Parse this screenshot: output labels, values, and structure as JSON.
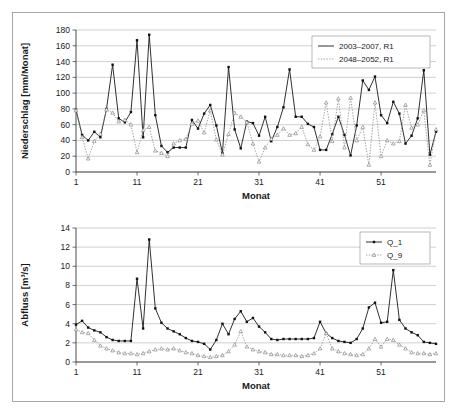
{
  "figure": {
    "background_color": "#ffffff",
    "border_color": "#a8a8a8",
    "solid_series_color": "#1a1a1a",
    "dotted_series_color": "#8a8a8a",
    "gridline_color": "#b0b0b0"
  },
  "chart_data": [
    {
      "id": "precipitation",
      "type": "line",
      "title": "",
      "xlabel": "Monat",
      "ylabel": "Niederschlag [mm/Monat]",
      "ylim": [
        0,
        180
      ],
      "xlim": [
        1,
        60
      ],
      "yticks": [
        0,
        20,
        40,
        60,
        80,
        100,
        120,
        140,
        160,
        180
      ],
      "xticks": [
        1,
        11,
        21,
        31,
        41,
        51
      ],
      "grid": true,
      "legend_position": "top-right",
      "x": [
        1,
        2,
        3,
        4,
        5,
        6,
        7,
        8,
        9,
        10,
        11,
        12,
        13,
        14,
        15,
        16,
        17,
        18,
        19,
        20,
        21,
        22,
        23,
        24,
        25,
        26,
        27,
        28,
        29,
        30,
        31,
        32,
        33,
        34,
        35,
        36,
        37,
        38,
        39,
        40,
        41,
        42,
        43,
        44,
        45,
        46,
        47,
        48,
        49,
        50,
        51,
        52,
        53,
        54,
        55,
        56,
        57,
        58,
        59,
        60
      ],
      "series": [
        {
          "name": "2003–2007, R1",
          "style": "solid",
          "marker": "filled-square",
          "values": [
            79,
            47,
            40,
            51,
            44,
            80,
            136,
            68,
            63,
            76,
            167,
            44,
            174,
            72,
            33,
            25,
            31,
            31,
            31,
            66,
            55,
            74,
            85,
            59,
            24,
            133,
            54,
            30,
            64,
            62,
            46,
            70,
            39,
            57,
            82,
            130,
            70,
            70,
            61,
            57,
            28,
            28,
            48,
            70,
            47,
            21,
            59,
            116,
            104,
            121,
            72,
            62,
            89,
            74,
            36,
            46,
            68,
            129,
            22,
            51
          ]
        },
        {
          "name": "2048–2052, R1",
          "style": "dotted",
          "marker": "open-triangle",
          "values": [
            78,
            44,
            17,
            39,
            48,
            79,
            75,
            64,
            66,
            60,
            25,
            53,
            57,
            27,
            24,
            20,
            36,
            40,
            42,
            61,
            65,
            50,
            78,
            41,
            22,
            48,
            75,
            70,
            63,
            36,
            13,
            31,
            42,
            47,
            55,
            47,
            49,
            57,
            35,
            28,
            45,
            88,
            39,
            93,
            31,
            94,
            40,
            57,
            9,
            88,
            20,
            40,
            36,
            39,
            85,
            56,
            60,
            78,
            9,
            54
          ]
        }
      ]
    },
    {
      "id": "runoff",
      "type": "line",
      "title": "",
      "xlabel": "Monat",
      "ylabel": "Abfluss [m³/s]",
      "ylim": [
        0,
        14
      ],
      "xlim": [
        1,
        60
      ],
      "yticks": [
        0,
        2,
        4,
        6,
        8,
        10,
        12,
        14
      ],
      "xticks": [
        1,
        11,
        21,
        31,
        41,
        51
      ],
      "grid": true,
      "legend_position": "top-right",
      "x": [
        1,
        2,
        3,
        4,
        5,
        6,
        7,
        8,
        9,
        10,
        11,
        12,
        13,
        14,
        15,
        16,
        17,
        18,
        19,
        20,
        21,
        22,
        23,
        24,
        25,
        26,
        27,
        28,
        29,
        30,
        31,
        32,
        33,
        34,
        35,
        36,
        37,
        38,
        39,
        40,
        41,
        42,
        43,
        44,
        45,
        46,
        47,
        48,
        49,
        50,
        51,
        52,
        53,
        54,
        55,
        56,
        57,
        58,
        59,
        60
      ],
      "series": [
        {
          "name": "Q_1",
          "style": "solid",
          "marker": "filled-square",
          "values": [
            3.9,
            4.3,
            3.6,
            3.3,
            3.1,
            2.6,
            2.3,
            2.2,
            2.2,
            2.2,
            8.7,
            3.5,
            12.8,
            5.6,
            4.1,
            3.5,
            3.2,
            2.9,
            2.5,
            2.2,
            2.1,
            1.9,
            1.3,
            2.3,
            4.0,
            2.9,
            4.5,
            5.3,
            4.2,
            4.6,
            3.7,
            3.1,
            2.4,
            2.3,
            2.4,
            2.4,
            2.4,
            2.4,
            2.4,
            2.5,
            4.2,
            3.0,
            2.5,
            2.2,
            2.1,
            2.0,
            2.4,
            3.5,
            5.7,
            6.2,
            4.1,
            4.2,
            9.6,
            4.4,
            3.5,
            3.1,
            2.8,
            2.1,
            2.0,
            1.9
          ]
        },
        {
          "name": "Q_9",
          "style": "dotted",
          "marker": "open-triangle",
          "values": [
            3.4,
            3.1,
            3.0,
            2.3,
            1.7,
            1.4,
            1.2,
            1.0,
            0.9,
            0.9,
            0.8,
            0.9,
            1.1,
            1.3,
            1.4,
            1.3,
            1.4,
            1.2,
            1.0,
            0.9,
            0.7,
            0.6,
            0.5,
            0.6,
            0.7,
            1.1,
            1.8,
            3.2,
            1.6,
            1.3,
            1.1,
            1.0,
            0.8,
            0.8,
            0.7,
            0.7,
            0.7,
            0.6,
            0.7,
            0.9,
            1.4,
            3.0,
            1.4,
            1.1,
            0.9,
            0.8,
            0.7,
            0.8,
            1.4,
            2.4,
            1.6,
            2.4,
            2.3,
            1.8,
            1.4,
            1.0,
            0.9,
            0.9,
            0.8,
            0.9
          ]
        }
      ]
    }
  ]
}
